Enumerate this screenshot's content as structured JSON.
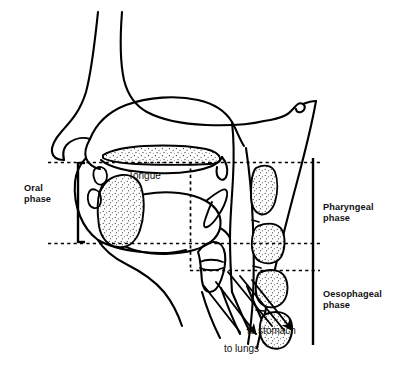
{
  "figure": {
    "type": "anatomical-line-diagram",
    "width": 401,
    "height": 373,
    "background_color": "#ffffff",
    "line_color": "#000000",
    "stipple_color": "#1a1a1a",
    "dash_color": "#000000"
  },
  "labels": {
    "oral_phase": "Oral\nphase",
    "pharyngeal_phase": "Pharyngeal\nphase",
    "oesophageal_phase": "Oesophageal\nphase",
    "tongue": "Tongue",
    "to_stomach": "to stomach",
    "to_lungs": "to lungs"
  },
  "brackets": [
    {
      "name": "oral-phase-bracket",
      "side": "left",
      "x": 78,
      "y_top": 162,
      "y_bottom": 243
    },
    {
      "name": "phases-bracket",
      "side": "right",
      "x": 313,
      "y_top": 158,
      "y_bottom": 345
    }
  ],
  "boundaries": [
    {
      "name": "palate-boundary",
      "orientation": "horizontal",
      "y": 162,
      "x_start": 48,
      "x_end": 320
    },
    {
      "name": "hyoid-boundary",
      "orientation": "horizontal",
      "y": 243,
      "x_start": 48,
      "x_end": 320
    },
    {
      "name": "cricopharyngeal-boundary",
      "orientation": "horizontal",
      "y": 270,
      "x_start": 190,
      "x_end": 320
    },
    {
      "name": "oral-cavity-right-edge",
      "orientation": "vertical",
      "x": 190,
      "y_start": 162,
      "y_end": 270
    }
  ],
  "arrows": [
    {
      "name": "to-stomach-arrow",
      "points_to": "oesophagus",
      "label": "to stomach"
    },
    {
      "name": "to-lungs-arrow",
      "points_to": "trachea",
      "label": "to lungs"
    }
  ],
  "anatomy_parts": [
    "nose",
    "nasal cavity",
    "hard palate",
    "soft palate",
    "uvula",
    "upper lip",
    "lower lip",
    "upper teeth",
    "lower teeth",
    "tongue",
    "mandible",
    "epiglottis",
    "larynx",
    "vocal folds",
    "trachea",
    "oesophagus",
    "pharynx",
    "cervical vertebra 1",
    "cervical vertebra 2",
    "cervical vertebra 3",
    "cervical vertebra 4"
  ]
}
